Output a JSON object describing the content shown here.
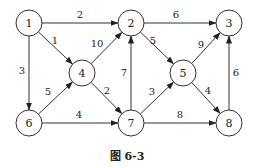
{
  "diagram": {
    "type": "directed-weighted-graph",
    "caption": "图 6-3",
    "nodes": [
      {
        "id": "1",
        "label": "1",
        "x": 29,
        "y": 23
      },
      {
        "id": "2",
        "label": "2",
        "x": 131,
        "y": 23
      },
      {
        "id": "3",
        "label": "3",
        "x": 229,
        "y": 23
      },
      {
        "id": "4",
        "label": "4",
        "x": 82,
        "y": 73
      },
      {
        "id": "5",
        "label": "5",
        "x": 183,
        "y": 73
      },
      {
        "id": "6",
        "label": "6",
        "x": 29,
        "y": 123
      },
      {
        "id": "7",
        "label": "7",
        "x": 131,
        "y": 123
      },
      {
        "id": "8",
        "label": "8",
        "x": 229,
        "y": 123
      }
    ],
    "edges": [
      {
        "from": "1",
        "to": "2",
        "weight": "2",
        "lx": 80,
        "ly": 18
      },
      {
        "from": "1",
        "to": "4",
        "weight": "1",
        "lx": 55,
        "ly": 44
      },
      {
        "from": "1",
        "to": "6",
        "weight": "3",
        "lx": 22,
        "ly": 74
      },
      {
        "from": "2",
        "to": "3",
        "weight": "6",
        "lx": 176,
        "ly": 18
      },
      {
        "from": "2",
        "to": "5",
        "weight": "5",
        "lx": 153,
        "ly": 44
      },
      {
        "from": "4",
        "to": "2",
        "weight": "10",
        "lx": 97,
        "ly": 47
      },
      {
        "from": "4",
        "to": "7",
        "weight": "2",
        "lx": 107,
        "ly": 94
      },
      {
        "from": "5",
        "to": "3",
        "weight": "9",
        "lx": 201,
        "ly": 48
      },
      {
        "from": "5",
        "to": "8",
        "weight": "4",
        "lx": 208,
        "ly": 94
      },
      {
        "from": "6",
        "to": "4",
        "weight": "5",
        "lx": 48,
        "ly": 95
      },
      {
        "from": "6",
        "to": "7",
        "weight": "4",
        "lx": 79,
        "ly": 118
      },
      {
        "from": "7",
        "to": "2",
        "weight": "7",
        "lx": 124,
        "ly": 76
      },
      {
        "from": "7",
        "to": "5",
        "weight": "3",
        "lx": 152,
        "ly": 95
      },
      {
        "from": "7",
        "to": "8",
        "weight": "8",
        "lx": 180,
        "ly": 118
      },
      {
        "from": "8",
        "to": "3",
        "weight": "6",
        "lx": 236,
        "ly": 76
      }
    ]
  }
}
